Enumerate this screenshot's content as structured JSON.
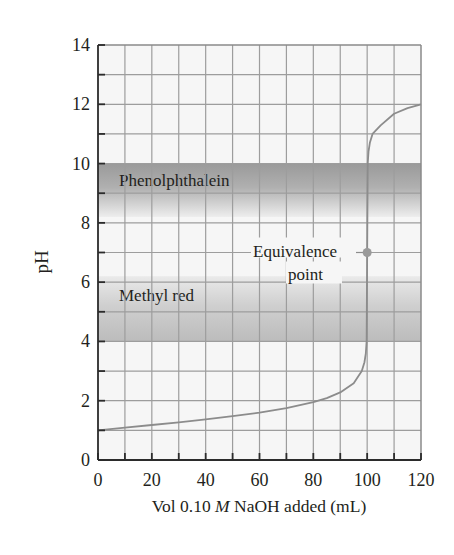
{
  "chart_data": {
    "type": "line",
    "title": "",
    "xlabel": "Vol 0.10 M NaOH added (mL)",
    "xlabel_parts": {
      "prefix": "Vol 0.10 ",
      "italic": "M",
      "suffix": " NaOH added (mL)"
    },
    "ylabel": "pH",
    "xlim": [
      0,
      120
    ],
    "ylim": [
      0,
      14
    ],
    "x_ticks": [
      0,
      20,
      40,
      60,
      80,
      100,
      120
    ],
    "y_ticks": [
      0,
      2,
      4,
      6,
      8,
      10,
      12,
      14
    ],
    "grid": {
      "on": true,
      "x_step": 10,
      "y_step": 1
    },
    "series": [
      {
        "name": "Titration curve",
        "color": "#8c8c8c",
        "x": [
          0,
          10,
          20,
          30,
          40,
          50,
          60,
          70,
          80,
          85,
          90,
          95,
          98,
          99,
          99.5,
          99.8,
          100,
          100.2,
          100.5,
          101,
          102,
          105,
          110,
          115,
          120
        ],
        "y": [
          1.0,
          1.09,
          1.18,
          1.27,
          1.37,
          1.48,
          1.6,
          1.75,
          1.95,
          2.09,
          2.28,
          2.59,
          3.0,
          3.3,
          3.6,
          4.0,
          7.0,
          10.0,
          10.4,
          10.7,
          11.0,
          11.29,
          11.68,
          11.87,
          12.0
        ]
      }
    ],
    "bands": [
      {
        "name": "Phenolphthalein",
        "label": "Phenolphthalein",
        "y_from": 8.2,
        "y_to": 10.0,
        "color_dark": "#9a9a9a",
        "color_light": "#ececec"
      },
      {
        "name": "Methyl red",
        "label": "Methyl red",
        "y_from": 4.0,
        "y_to": 6.2,
        "color_dark": "#bdbdbd",
        "color_light": "#e9e9e9"
      }
    ],
    "annotations": [
      {
        "text_line1": "Equivalence",
        "text_line2": "point",
        "x": 100,
        "y": 7.0,
        "marker_color": "#9a9a9a"
      }
    ],
    "legend": null
  }
}
